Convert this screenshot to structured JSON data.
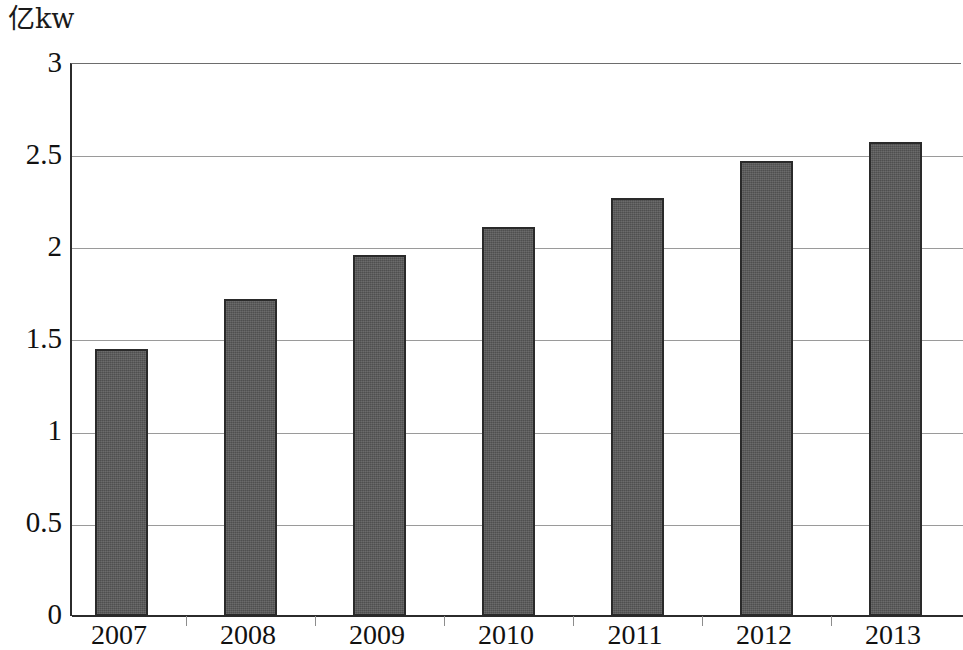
{
  "chart_data": {
    "type": "bar",
    "title": "",
    "subtitle": "",
    "xlabel": "",
    "ylabel": "亿kw",
    "unit_label": "亿kw",
    "categories": [
      "2007",
      "2008",
      "2009",
      "2010",
      "2011",
      "2012",
      "2013"
    ],
    "values": [
      1.45,
      1.72,
      1.96,
      2.11,
      2.27,
      2.47,
      2.57
    ],
    "series": [
      {
        "name": "",
        "values": [
          1.45,
          1.72,
          1.96,
          2.11,
          2.27,
          2.47,
          2.57
        ]
      }
    ],
    "ylim": [
      0,
      3
    ],
    "y_ticks": [
      0,
      0.5,
      1,
      1.5,
      2,
      2.5,
      3
    ],
    "y_tick_labels": [
      "0",
      "0.5",
      "1",
      "1.5",
      "2",
      "2.5",
      "3"
    ],
    "grid": true,
    "grid_axis": "y",
    "legend": false,
    "legend_position": "none",
    "bar_color": "#5a5a5a",
    "bar_border_color": "#2a2a2a",
    "axis_color": "#2b2b2b",
    "gridline_color": "#9a9a9a",
    "background_color": "#ffffff",
    "annotations": []
  },
  "axes": {
    "y_tick_0": "0",
    "y_tick_1": "0.5",
    "y_tick_2": "1",
    "y_tick_3": "1.5",
    "y_tick_4": "2",
    "y_tick_5": "2.5",
    "y_tick_6": "3",
    "x_tick_0": "2007",
    "x_tick_1": "2008",
    "x_tick_2": "2009",
    "x_tick_3": "2010",
    "x_tick_4": "2011",
    "x_tick_5": "2012",
    "x_tick_6": "2013"
  }
}
